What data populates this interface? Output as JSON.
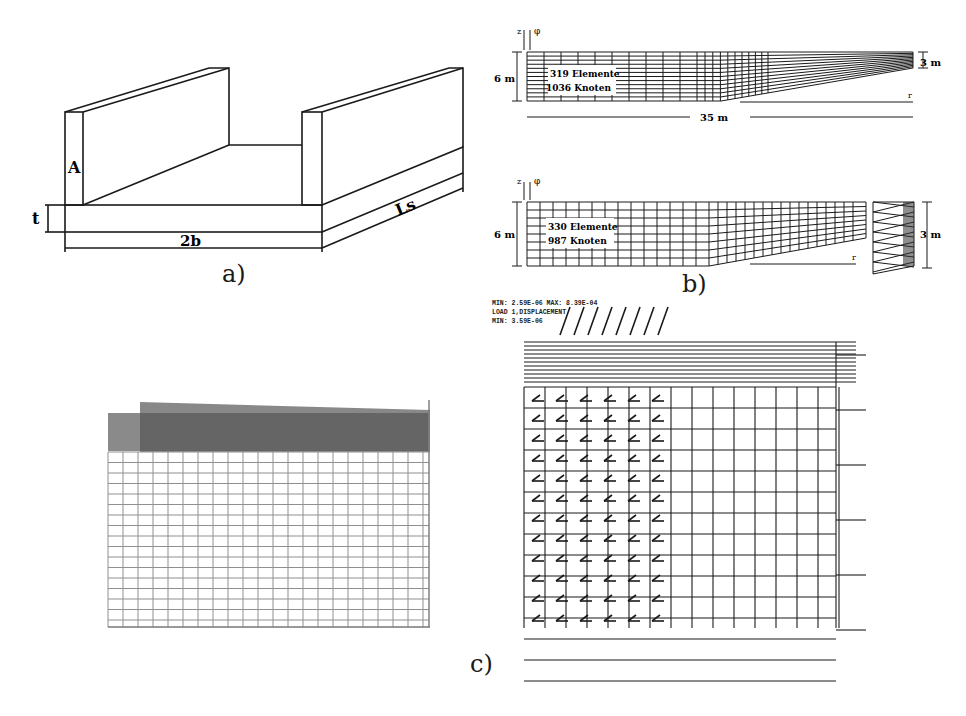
{
  "figure": {
    "panel_a": {
      "caption": "a)",
      "labels": {
        "wall": "A",
        "thickness": "t",
        "width": "2b",
        "length": "Ls"
      }
    },
    "panel_b": {
      "caption": "b)",
      "mesh_top": {
        "elements": "319 Elemente",
        "nodes": "1036 Knoten",
        "height_left": "6 m",
        "height_right": "3 m",
        "length": "35 m",
        "axis_z": "z",
        "axis_phi": "φ",
        "axis_r": "r"
      },
      "mesh_bottom": {
        "elements": "330 Elemente",
        "nodes": "987 Knoten",
        "height_left": "6 m",
        "height_right": "3 m",
        "axis_z": "z",
        "axis_phi": "φ",
        "axis_r": "r"
      }
    },
    "panel_c": {
      "caption": "c)",
      "header_lines": [
        "MIN: 2.59E-06  MAX: 8.39E-04",
        "LOAD 1,DISPLACEMENT",
        "MIN: 3.59E-06"
      ]
    }
  },
  "colors": {
    "ink": "#1a1a1a",
    "gray_fill": "#8a8a8a",
    "light_line": "#9a9a9a"
  }
}
